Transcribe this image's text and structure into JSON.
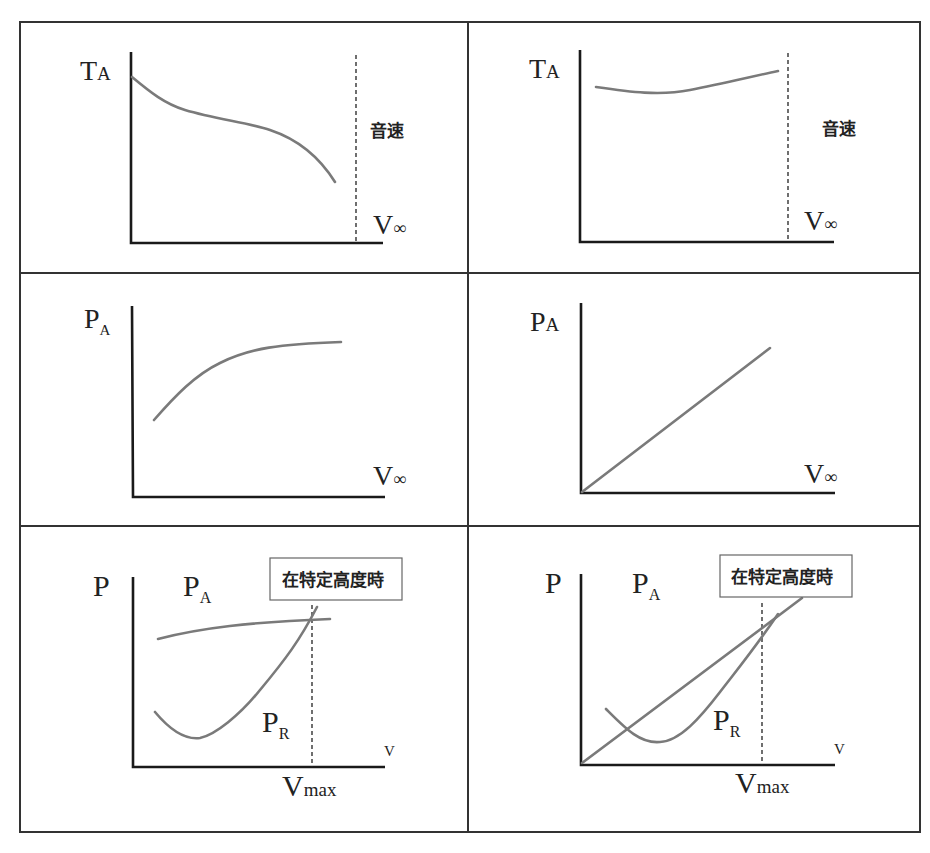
{
  "figure": {
    "layout": "3 rows x 2 columns grid of conceptual graphs",
    "colors": {
      "frame": "#333333",
      "axis": "#1a1a1a",
      "curve": "#7a7a7a",
      "background": "#ffffff"
    }
  },
  "panels": [
    {
      "id": "top-left",
      "y_label": "T",
      "y_label_sub": "A",
      "x_label": "V",
      "x_label_sub": "∞",
      "annotation": "音速",
      "description": "Thrust available decreasing with velocity, dashed line at speed of sound"
    },
    {
      "id": "top-right",
      "y_label": "T",
      "y_label_sub": "A",
      "x_label": "V",
      "x_label_sub": "∞",
      "annotation": "音速",
      "description": "Thrust available nearly constant, slight rise, dashed line at speed of sound"
    },
    {
      "id": "mid-left",
      "y_label": "P",
      "y_label_sub": "A",
      "x_label": "V",
      "x_label_sub": "∞",
      "description": "Power available rising and leveling off"
    },
    {
      "id": "mid-right",
      "y_label": "P",
      "y_label_sub": "A",
      "x_label": "V",
      "x_label_sub": "∞",
      "description": "Power available linear through origin"
    },
    {
      "id": "bottom-left",
      "y_label": "P",
      "curve_label_a": "P",
      "curve_label_a_sub": "A",
      "curve_label_r": "P",
      "curve_label_r_sub": "R",
      "x_label": "V",
      "vmax_label": "V",
      "vmax_sub": "max",
      "box_label": "在特定高度時"
    },
    {
      "id": "bottom-right",
      "y_label": "P",
      "curve_label_a": "P",
      "curve_label_a_sub": "A",
      "curve_label_r": "P",
      "curve_label_r_sub": "R",
      "x_label": "V",
      "vmax_label": "V",
      "vmax_sub": "max",
      "box_label": "在特定高度時"
    }
  ]
}
